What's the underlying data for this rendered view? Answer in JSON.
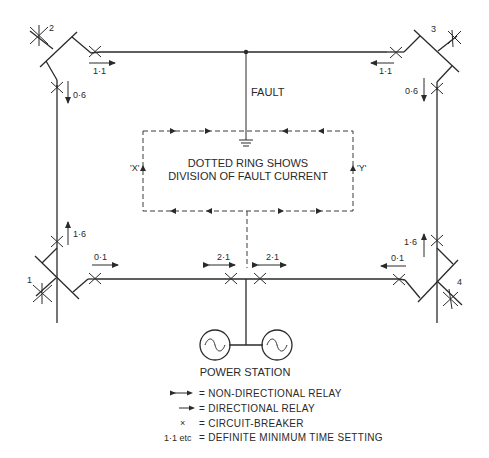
{
  "diagram": {
    "busbars": [
      {
        "id": "1",
        "label": "1"
      },
      {
        "id": "2",
        "label": "2"
      },
      {
        "id": "3",
        "label": "3"
      },
      {
        "id": "4",
        "label": "4"
      }
    ],
    "relays": [
      {
        "location": "bus2-to-top",
        "setting": "1·1",
        "direction": "right",
        "type": "directional"
      },
      {
        "location": "bus3-to-top",
        "setting": "1·1",
        "direction": "left",
        "type": "directional"
      },
      {
        "location": "bus2-to-left",
        "setting": "0·6",
        "direction": "down",
        "type": "directional"
      },
      {
        "location": "bus3-to-right",
        "setting": "0·6",
        "direction": "down",
        "type": "directional"
      },
      {
        "location": "bus1-to-left",
        "setting": "1·6",
        "direction": "up",
        "type": "directional"
      },
      {
        "location": "bus4-to-right",
        "setting": "1·6",
        "direction": "up",
        "type": "directional"
      },
      {
        "location": "bus1-to-bottom",
        "setting": "0·1",
        "direction": "right",
        "type": "directional"
      },
      {
        "location": "bus4-to-bottom",
        "setting": "0·1",
        "direction": "left",
        "type": "directional"
      },
      {
        "location": "station-left",
        "setting": "2·1",
        "direction": "both",
        "type": "non-directional"
      },
      {
        "location": "station-right",
        "setting": "2·1",
        "direction": "both",
        "type": "non-directional"
      }
    ],
    "fault_label": "FAULT",
    "ring_note_line1": "DOTTED RING SHOWS",
    "ring_note_line2": "DIVISION OF FAULT CURRENT",
    "ring_label_x": "'X'",
    "ring_label_y": "'Y'",
    "power_station_label": "POWER STATION",
    "legend": [
      {
        "symbol": "double-arrow",
        "text": "= NON-DIRECTIONAL RELAY"
      },
      {
        "symbol": "single-arrow",
        "text": "= DIRECTIONAL RELAY"
      },
      {
        "symbol": "×",
        "text": "= CIRCUIT-BREAKER"
      },
      {
        "symbol": "1·1 etc",
        "text": "= DEFINITE MINIMUM TIME SETTING"
      }
    ],
    "colors": {
      "line": "#2a2a2a",
      "background": "#ffffff"
    }
  }
}
